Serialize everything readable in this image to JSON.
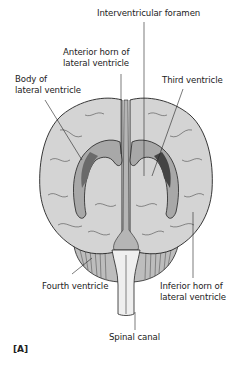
{
  "figure": {
    "id_label": "[A]",
    "colors": {
      "brain_fill": "#d4d4d4",
      "ventricle_fill": "#a8a8a8",
      "ventricle_dark": "#555555",
      "cerebellum_fill": "#bdbdbd",
      "spinal_cord_fill": "#efefef",
      "outline": "#222222",
      "background": "#ffffff"
    }
  },
  "labels": {
    "interventricular_foramen": "Interventricular foramen",
    "anterior_horn": [
      "Anterior horn of",
      "lateral ventricle"
    ],
    "body_lateral": [
      "Body of",
      "lateral ventricle"
    ],
    "third_ventricle": "Third ventricle",
    "fourth_ventricle": "Fourth ventricle",
    "inferior_horn": [
      "Inferior horn of",
      "lateral ventricle"
    ],
    "spinal_canal": "Spinal canal"
  }
}
